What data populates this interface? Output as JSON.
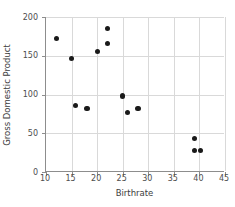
{
  "chart_data": {
    "type": "scatter",
    "title": "",
    "xlabel": "Birthrate",
    "ylabel": "Gross Domestic Product",
    "xlim": [
      10,
      45
    ],
    "ylim": [
      0,
      200
    ],
    "xticks": [
      10,
      15,
      20,
      25,
      30,
      35,
      40,
      45
    ],
    "yticks": [
      0,
      50,
      100,
      150,
      200
    ],
    "xtick_labels": [
      "10",
      "15",
      "20",
      "25",
      "30",
      "35",
      "40",
      "45"
    ],
    "ytick_labels": [
      "0",
      "50",
      "100",
      "150",
      "200"
    ],
    "grid": true,
    "legend": null,
    "marker_color": "#1a1a1a",
    "points": [
      {
        "x": 12.0,
        "y": 172
      },
      {
        "x": 15.0,
        "y": 146
      },
      {
        "x": 15.7,
        "y": 86
      },
      {
        "x": 18.0,
        "y": 82
      },
      {
        "x": 20.0,
        "y": 156
      },
      {
        "x": 22.0,
        "y": 185
      },
      {
        "x": 22.0,
        "y": 166
      },
      {
        "x": 25.0,
        "y": 98
      },
      {
        "x": 26.0,
        "y": 77
      },
      {
        "x": 28.0,
        "y": 82
      },
      {
        "x": 39.0,
        "y": 43
      },
      {
        "x": 39.0,
        "y": 28
      },
      {
        "x": 40.2,
        "y": 28
      }
    ]
  }
}
